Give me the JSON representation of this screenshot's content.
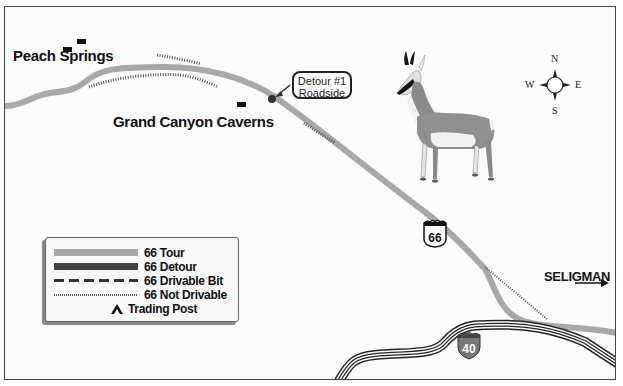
{
  "map": {
    "towns": {
      "peach_springs": "Peach Springs",
      "grand_canyon_caverns": "Grand Canyon Caverns"
    },
    "callout": {
      "line1": "Detour #1",
      "line2": "Roadside"
    },
    "destination": {
      "label": "SELIGMAN",
      "arrow": "arrow-right-icon"
    },
    "shields": {
      "us_route": "66",
      "interstate": "40"
    },
    "compass": {
      "n": "N",
      "s": "S",
      "e": "E",
      "w": "W"
    },
    "illustration": "pronghorn-antelope"
  },
  "legend": {
    "items": [
      {
        "label": "66 Tour",
        "style": "solid-light",
        "color": "#a8a8a8"
      },
      {
        "label": "66 Detour",
        "style": "solid-dark",
        "color": "#444444"
      },
      {
        "label": "66 Drivable Bit",
        "style": "dashed",
        "color": "#333333"
      },
      {
        "label": "66 Not Drivable",
        "style": "dotted",
        "color": "#555555"
      },
      {
        "label": "Trading Post",
        "style": "tent-icon",
        "color": "#111111"
      }
    ]
  },
  "colors": {
    "route_tour": "#a8a8a8",
    "route_detour": "#444444",
    "interstate_shield": "#777777",
    "background": "#fbfbfb",
    "text": "#111111"
  }
}
